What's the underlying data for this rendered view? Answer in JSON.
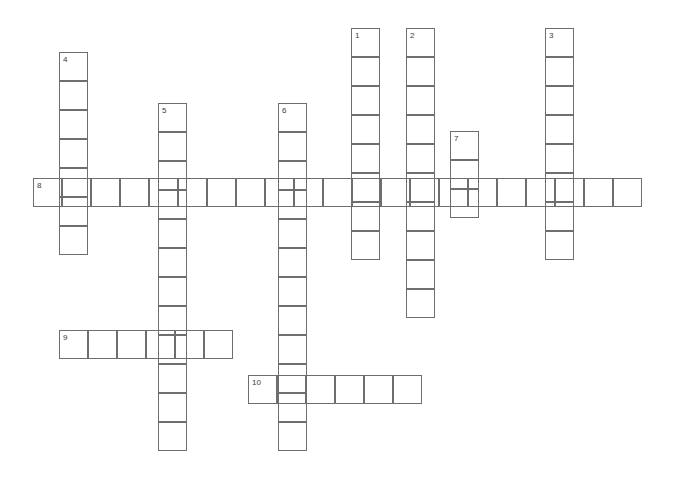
{
  "page": {
    "background_color": "#ffffff",
    "cell_border_color": "#6e6e6e",
    "number_color": "#3a3a3a",
    "width": 679,
    "height": 485
  },
  "grid": {
    "cell_size": 29,
    "origin_x": 33,
    "origin_y": 28,
    "columns": 22,
    "rows": 16
  },
  "entries": [
    {
      "number": "1",
      "direction": "down",
      "length": 8,
      "start_x": 351,
      "start_y": 28,
      "label_text": "1"
    },
    {
      "number": "2",
      "direction": "down",
      "length": 10,
      "start_x": 406,
      "start_y": 28,
      "label_text": "2"
    },
    {
      "number": "3",
      "direction": "down",
      "length": 8,
      "start_x": 545,
      "start_y": 28,
      "label_text": "3"
    },
    {
      "number": "4",
      "direction": "down",
      "length": 7,
      "start_x": 59,
      "start_y": 52,
      "label_text": "4"
    },
    {
      "number": "5",
      "direction": "down",
      "length": 12,
      "start_x": 158,
      "start_y": 103,
      "label_text": "5"
    },
    {
      "number": "6",
      "direction": "down",
      "length": 12,
      "start_x": 278,
      "start_y": 103,
      "label_text": "6"
    },
    {
      "number": "7",
      "direction": "down",
      "length": 3,
      "start_x": 450,
      "start_y": 131,
      "label_text": "7"
    },
    {
      "number": "8",
      "direction": "across",
      "length": 21,
      "start_x": 33,
      "start_y": 178,
      "label_text": "8"
    },
    {
      "number": "9",
      "direction": "across",
      "length": 6,
      "start_x": 59,
      "start_y": 330,
      "label_text": "9"
    },
    {
      "number": "10",
      "direction": "across",
      "length": 6,
      "start_x": 248,
      "start_y": 375,
      "label_text": "10"
    }
  ],
  "letters": []
}
